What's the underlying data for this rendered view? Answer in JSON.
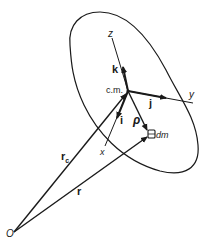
{
  "diagram": {
    "type": "rigid-body-coordinate-frame",
    "stroke_color": "#1a1a1a",
    "background": "#ffffff",
    "labels": {
      "origin": "O",
      "center_of_mass": "c.m.",
      "axis_x": "x",
      "axis_y": "y",
      "axis_z": "z",
      "unit_i": "i",
      "unit_j": "j",
      "unit_k": "k",
      "rho": "ρ",
      "mass_element": "dm",
      "r_c_main": "r",
      "r_c_sub": "c",
      "r": "r"
    }
  }
}
